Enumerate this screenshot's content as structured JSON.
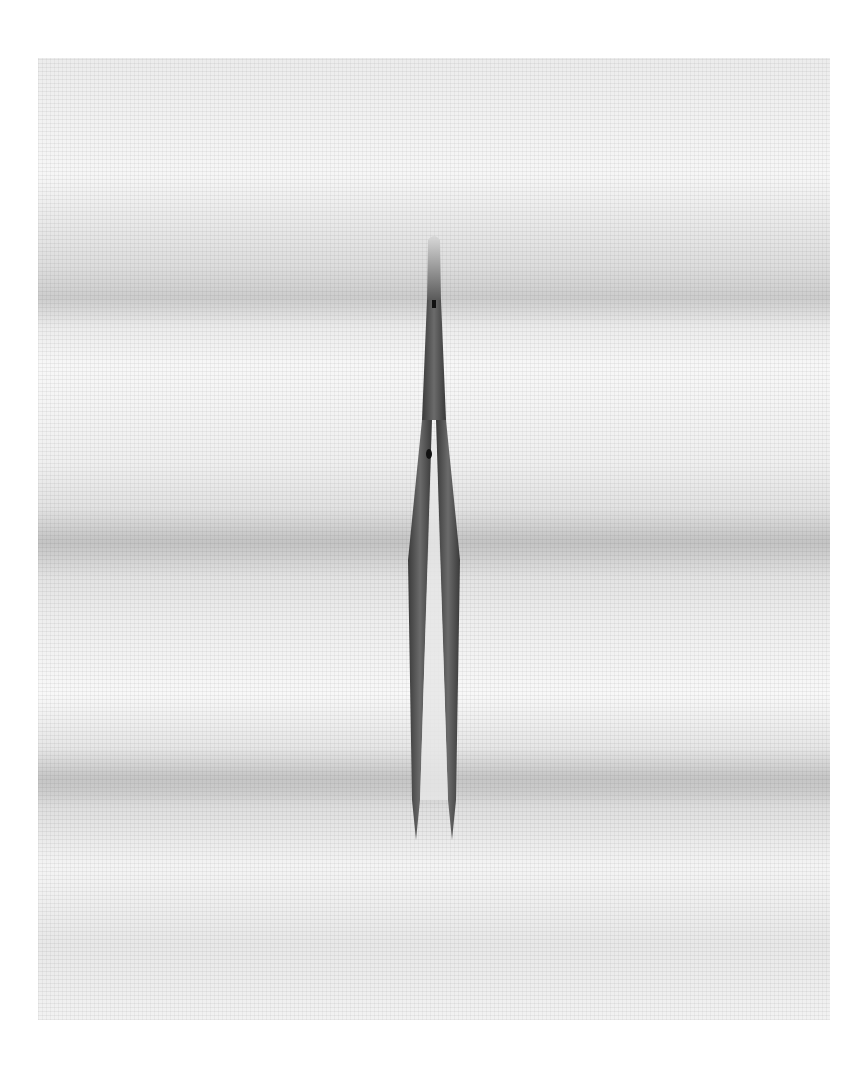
{
  "image": {
    "description": "Top-down photo of a pair of stainless steel tweezers lying vertically on white surgical gauze",
    "subject": "tweezers",
    "background": "white gauze fabric with horizontal folds",
    "colors": {
      "page_bg": "#ffffff",
      "gauze": "#efefef",
      "gauze_shadow": "#d6d6d6",
      "steel_dark": "#3a3a3a",
      "steel_mid": "#6b6b6b",
      "steel_light": "#bdbdbd"
    }
  }
}
